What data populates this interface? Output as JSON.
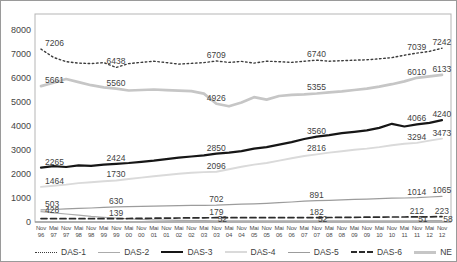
{
  "chart_data": {
    "type": "line",
    "title": "",
    "grid": false,
    "legend_position": "bottom",
    "ylim": [
      0,
      8000
    ],
    "yticks": [
      0,
      1000,
      2000,
      3000,
      4000,
      5000,
      6000,
      7000,
      8000
    ],
    "x_months": [
      "Nov",
      "Mai",
      "Nov",
      "Mai",
      "Nov",
      "Mai",
      "Nov",
      "Mai",
      "Nov",
      "Mai",
      "Nov",
      "Mai",
      "Nov",
      "Mai",
      "Nov",
      "Mai",
      "Nov",
      "Mai",
      "Nov",
      "Mai",
      "Nov",
      "Mai",
      "Nov",
      "Mai",
      "Nov",
      "Mai",
      "Nov",
      "Mai",
      "Nov",
      "Mai",
      "Nov",
      "Mai",
      "Nov"
    ],
    "x_years": [
      "96",
      "97",
      "97",
      "98",
      "98",
      "99",
      "99",
      "00",
      "00",
      "01",
      "01",
      "02",
      "02",
      "03",
      "03",
      "04",
      "04",
      "05",
      "05",
      "06",
      "06",
      "07",
      "07",
      "08",
      "08",
      "09",
      "09",
      "10",
      "10",
      "11",
      "11",
      "12",
      "12"
    ],
    "label_indices": [
      0,
      6,
      14,
      22,
      30,
      32
    ],
    "series": [
      {
        "name": "DAS-1",
        "color": "#3c3c3c",
        "width": 1.4,
        "dash": "dotted",
        "label_dx": 0,
        "label_dy": -10,
        "values": [
          7206,
          6860,
          6680,
          6620,
          6600,
          6640,
          6438,
          6600,
          6650,
          6700,
          6640,
          6580,
          6610,
          6640,
          6709,
          6650,
          6690,
          6620,
          6700,
          6680,
          6650,
          6700,
          6740,
          6700,
          6720,
          6740,
          6760,
          6800,
          6850,
          6950,
          7039,
          7110,
          7242
        ],
        "labels": [
          7206,
          6438,
          6709,
          6740,
          7039,
          7242
        ]
      },
      {
        "name": "DAS-2",
        "color": "#ababab",
        "width": 1.2,
        "dash": "solid",
        "label_dx": 6,
        "label_dy": -6,
        "values": [
          428,
          385,
          335,
          285,
          235,
          195,
          165,
          135,
          110,
          92,
          80,
          70,
          62,
          56,
          52,
          52,
          52,
          52,
          52,
          52,
          52,
          52,
          52,
          52,
          51,
          51,
          51,
          51,
          51,
          51,
          51,
          54,
          58
        ],
        "labels": [
          428,
          null,
          52,
          52,
          51,
          58
        ]
      },
      {
        "name": "DAS-3",
        "color": "#161616",
        "width": 2.2,
        "dash": "solid",
        "label_dx": 0,
        "label_dy": -10,
        "values": [
          2265,
          2330,
          2290,
          2360,
          2340,
          2390,
          2424,
          2460,
          2510,
          2560,
          2620,
          2680,
          2730,
          2780,
          2850,
          2890,
          2950,
          3060,
          3120,
          3220,
          3330,
          3460,
          3560,
          3620,
          3700,
          3760,
          3820,
          3920,
          4090,
          3980,
          4066,
          4130,
          4240
        ],
        "labels": [
          2265,
          2424,
          2850,
          3560,
          4066,
          4240
        ]
      },
      {
        "name": "DAS-4",
        "color": "#dadada",
        "width": 1.9,
        "dash": "solid",
        "label_dx": 0,
        "label_dy": -10,
        "values": [
          1464,
          1510,
          1560,
          1620,
          1660,
          1700,
          1730,
          1790,
          1850,
          1910,
          1960,
          2010,
          2050,
          2080,
          2096,
          2200,
          2300,
          2390,
          2460,
          2560,
          2660,
          2750,
          2816,
          2890,
          2950,
          3010,
          3060,
          3120,
          3200,
          3260,
          3294,
          3390,
          3473
        ],
        "labels": [
          1464,
          1730,
          2096,
          2816,
          3294,
          3473
        ]
      },
      {
        "name": "DAS-5",
        "color": "#9c9c9c",
        "width": 1.2,
        "dash": "solid",
        "label_dx": 0,
        "label_dy": -10,
        "values": [
          503,
          520,
          545,
          565,
          585,
          610,
          630,
          640,
          650,
          660,
          670,
          680,
          690,
          696,
          702,
          720,
          740,
          760,
          780,
          805,
          835,
          865,
          891,
          905,
          925,
          940,
          955,
          970,
          990,
          1002,
          1014,
          1040,
          1065
        ],
        "labels": [
          503,
          630,
          702,
          891,
          1014,
          1065
        ]
      },
      {
        "name": "DAS-6",
        "color": "#2b2b2b",
        "width": 1.7,
        "dash": "dashed",
        "label_dx": 0,
        "label_dy": -10,
        "values": [
          140,
          140,
          139,
          139,
          139,
          139,
          139,
          146,
          152,
          158,
          163,
          168,
          172,
          176,
          179,
          180,
          180,
          180,
          181,
          181,
          182,
          182,
          182,
          186,
          190,
          195,
          199,
          204,
          207,
          210,
          212,
          217,
          223
        ],
        "labels": [
          null,
          139,
          179,
          182,
          212,
          223
        ]
      },
      {
        "name": "NE",
        "color": "#c6c6c6",
        "width": 2.7,
        "dash": "solid",
        "label_dx": 0,
        "label_dy": -10,
        "values": [
          5661,
          5800,
          5960,
          5830,
          5700,
          5610,
          5560,
          5480,
          5500,
          5520,
          5490,
          5470,
          5450,
          5350,
          4926,
          4820,
          4980,
          5200,
          5100,
          5250,
          5300,
          5320,
          5355,
          5400,
          5440,
          5500,
          5560,
          5640,
          5740,
          5860,
          6010,
          6070,
          6133
        ],
        "labels": [
          5661,
          5560,
          4926,
          5355,
          6010,
          6133
        ]
      }
    ]
  }
}
